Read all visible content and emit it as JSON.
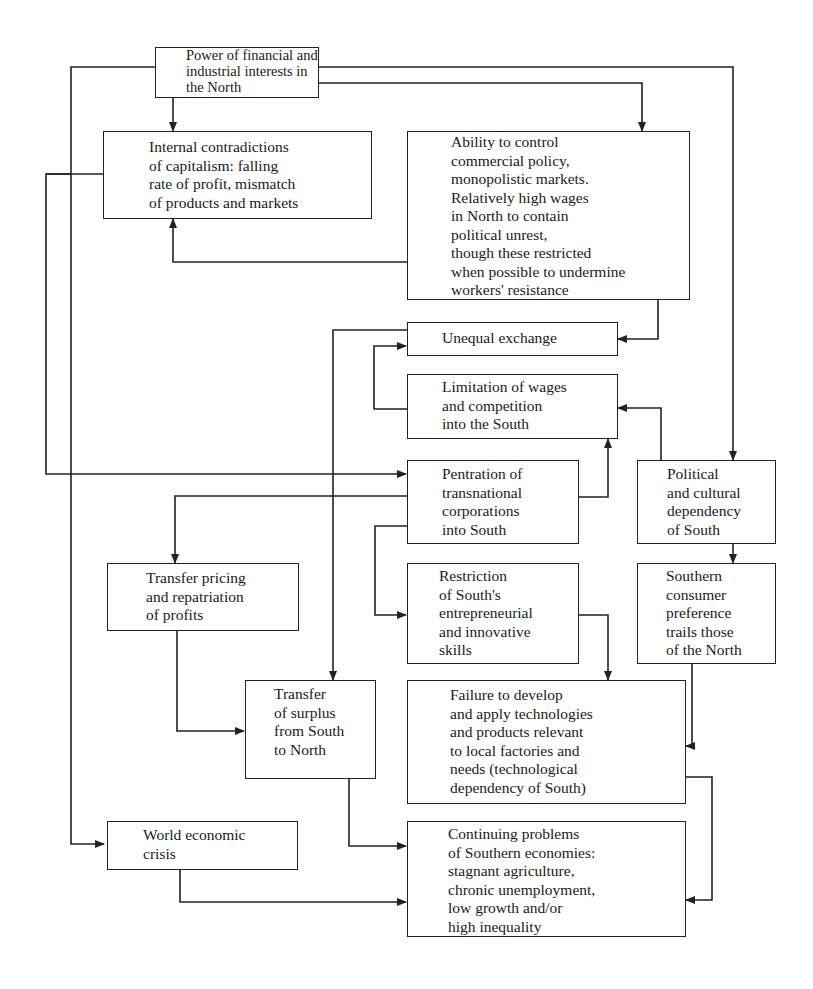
{
  "diagram": {
    "type": "flowchart",
    "nodes": {
      "power": {
        "label": "Power of financial and\nindustrial interests in\nthe North"
      },
      "internal": {
        "label": "Internal contradictions\nof capitalism: falling\nrate of profit, mismatch\nof products and markets"
      },
      "ability": {
        "label": "Ability to control\ncommercial policy,\nmonopolistic markets.\nRelatively high wages\nin North to contain\npolitical unrest,\nthough these restricted\nwhen possible to undermine\nworkers' resistance"
      },
      "unequal": {
        "label": "Unequal exchange"
      },
      "limitation": {
        "label": "Limitation of wages\nand competition\ninto the South"
      },
      "pentration": {
        "label": "Pentration of\ntransnational\ncorporations\ninto South"
      },
      "political": {
        "label": "Political\nand cultural\ndependency\nof South"
      },
      "transfer_pricing": {
        "label": "Transfer pricing\nand repatriation\nof profits"
      },
      "restriction": {
        "label": "Restriction\nof South's\nentrepreneurial\nand innovative\nskills"
      },
      "southern_consumer": {
        "label": "Southern\nconsumer\npreference\ntrails those\nof the North"
      },
      "transfer_surplus": {
        "label": "Transfer\nof surplus\nfrom South\nto North"
      },
      "failure": {
        "label": "Failure to develop\nand apply technologies\nand products relevant\nto local factories and\nneeds (technological\ndependency of South)"
      },
      "world_crisis": {
        "label": "World economic\ncrisis"
      },
      "continuing": {
        "label": "Continuing problems\nof Southern economies:\nstagnant agriculture,\nchronic unemployment,\nlow growth and/or\nhigh inequality"
      }
    },
    "edges": [
      {
        "from": "power",
        "to": "internal"
      },
      {
        "from": "power",
        "to": "ability"
      },
      {
        "from": "power",
        "to": "political"
      },
      {
        "from": "power",
        "to": "world_crisis"
      },
      {
        "from": "ability",
        "to": "internal"
      },
      {
        "from": "ability",
        "to": "unequal"
      },
      {
        "from": "internal",
        "to": "pentration"
      },
      {
        "from": "limitation",
        "to": "unequal"
      },
      {
        "from": "unequal",
        "to": "transfer_surplus"
      },
      {
        "from": "political",
        "to": "limitation"
      },
      {
        "from": "pentration",
        "to": "limitation"
      },
      {
        "from": "limitation",
        "to": "pentration"
      },
      {
        "from": "pentration",
        "to": "transfer_pricing"
      },
      {
        "from": "pentration",
        "to": "restriction"
      },
      {
        "from": "political",
        "to": "southern_consumer"
      },
      {
        "from": "transfer_pricing",
        "to": "transfer_surplus"
      },
      {
        "from": "restriction",
        "to": "failure"
      },
      {
        "from": "southern_consumer",
        "to": "failure"
      },
      {
        "from": "transfer_surplus",
        "to": "continuing"
      },
      {
        "from": "failure",
        "to": "continuing"
      },
      {
        "from": "world_crisis",
        "to": "continuing"
      }
    ]
  }
}
